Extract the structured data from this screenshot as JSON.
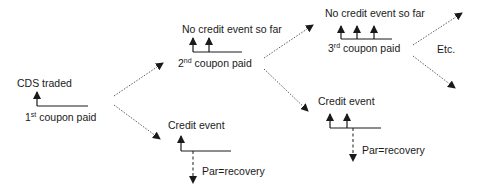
{
  "diagram": {
    "nodes": {
      "start": {
        "title": "CDS traded",
        "coupon_num": "1",
        "coupon_sup": "st",
        "coupon_label": "coupon paid"
      },
      "upper_1": {
        "title": "No credit event so far",
        "coupon_num": "2",
        "coupon_sup": "nd",
        "coupon_label": "coupon paid"
      },
      "lower_1": {
        "title": "Credit event",
        "payoff": "Par=recovery"
      },
      "upper_2": {
        "title": "No credit event so far",
        "coupon_num": "3",
        "coupon_sup": "rd",
        "coupon_label": "coupon paid"
      },
      "lower_2": {
        "title": "Credit event",
        "payoff": "Par=recovery"
      },
      "continuation": {
        "label": "Etc."
      }
    },
    "colors": {
      "line": "#1a1a1a",
      "text": "#1a1a1a",
      "background": "#ffffff"
    }
  }
}
